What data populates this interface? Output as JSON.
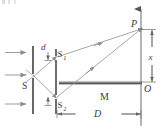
{
  "figure": {
    "type": "optics-ray-diagram",
    "colors": {
      "ink": "#3a3a3a",
      "ray": "#8e8e8e",
      "barrier": "#6e6e6e",
      "mirror_dark": "#4a4a4a",
      "mirror_light": "#c9c9c9",
      "background": "#ffffff"
    },
    "labels": {
      "source_slit": "S",
      "slit_upper": "S",
      "slit_upper_sub": "1",
      "slit_lower": "S",
      "slit_lower_sub": "2",
      "slit_separation": "d",
      "mirror": "M",
      "screen_point": "P",
      "screen_origin": "O",
      "point_height": "x",
      "screen_distance": "D"
    },
    "elements": [
      {
        "name": "incident-wave-arrows",
        "count": 3,
        "direction": "rightward"
      },
      {
        "name": "first-barrier",
        "slits": 1,
        "slit_label": "S"
      },
      {
        "name": "second-barrier",
        "slits": 2,
        "slit_labels": [
          "S1",
          "S2"
        ]
      },
      {
        "name": "mirror",
        "label": "M",
        "orientation": "horizontal"
      },
      {
        "name": "screen",
        "label_top": "P",
        "label_origin": "O"
      },
      {
        "name": "dimension-d",
        "label": "d",
        "between": [
          "S1",
          "S2"
        ]
      },
      {
        "name": "dimension-D",
        "label": "D",
        "between": [
          "second-barrier",
          "screen"
        ]
      },
      {
        "name": "dimension-x",
        "label": "x",
        "between": [
          "O",
          "P"
        ]
      }
    ]
  }
}
